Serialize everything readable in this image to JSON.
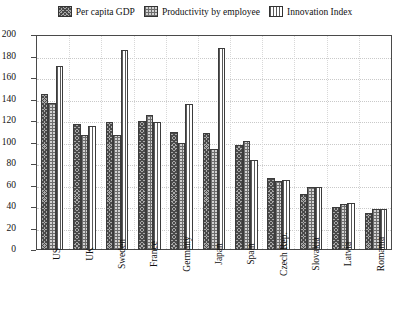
{
  "chart_data": {
    "type": "bar",
    "title": "",
    "subtitle": "",
    "xlabel": "",
    "ylabel": "",
    "ylim": [
      0,
      200
    ],
    "ytick_step": 20,
    "yticks": [
      200,
      180,
      160,
      140,
      120,
      100,
      80,
      60,
      40,
      20,
      0
    ],
    "grid": true,
    "legend_position": "top-center",
    "categories": [
      "US",
      "UK",
      "Sweden",
      "France",
      "Germany",
      "Japan",
      "Spain",
      "Czech Rep.",
      "Slovakia",
      "Latvia",
      "Romania"
    ],
    "series": [
      {
        "name": "Per capita GDP",
        "pattern": "crosshatch",
        "values": [
          145,
          117,
          119,
          120,
          110,
          109,
          98,
          67,
          52,
          40,
          34
        ]
      },
      {
        "name": "Productivity by employee",
        "pattern": "checker",
        "values": [
          137,
          107,
          107,
          126,
          100,
          94,
          101,
          64,
          59,
          43,
          38
        ]
      },
      {
        "name": "Innovation Index",
        "pattern": "vlines",
        "values": [
          171,
          115,
          186,
          119,
          136,
          188,
          84,
          65,
          59,
          44,
          38
        ]
      }
    ]
  },
  "colors": {
    "axis": "#4a4a4a",
    "grid": "#c9c9c9",
    "series_crosshatch": "#a9a9a9",
    "series_checker": "#d2d2d2",
    "series_vlines": "#ffffff",
    "background": "#ffffff"
  }
}
